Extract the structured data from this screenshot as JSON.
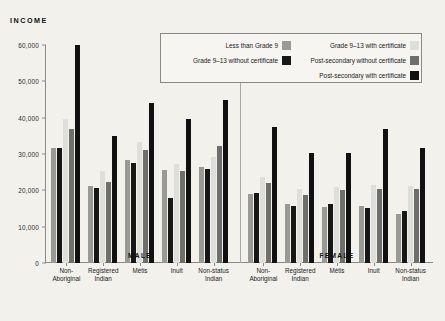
{
  "chart_data": {
    "type": "bar",
    "title": "",
    "ylabel": "INCOME",
    "xlabel": "",
    "ylim": [
      0,
      60000
    ],
    "yticks": [
      0,
      10000,
      20000,
      30000,
      40000,
      50000,
      60000
    ],
    "ytick_labels": [
      "0",
      "10,000",
      "20,000",
      "30,000",
      "40,000",
      "50,000",
      "60,000"
    ],
    "grid": false,
    "legend_position": "top-right",
    "panels": [
      {
        "name": "MALE",
        "categories": [
          "Non-\nAboriginal",
          "Registered\nIndian",
          "Métis",
          "Inuit",
          "Non-status\nIndian"
        ],
        "series": [
          {
            "name": "Less than Grade 9",
            "values": [
              31800,
              21200,
              28400,
              25600,
              26400
            ]
          },
          {
            "name": "Grade 9–13 without certificate",
            "values": [
              31800,
              20600,
              27600,
              17800,
              26000
            ]
          },
          {
            "name": "Grade 9–13 with certificate",
            "values": [
              39600,
              25400,
              33400,
              27200,
              29200
            ]
          },
          {
            "name": "Post-secondary without certificate",
            "values": [
              36800,
              22400,
              31200,
              25200,
              32300
            ]
          },
          {
            "name": "Post-secondary with certificate",
            "values": [
              60000,
              35000,
              44000,
              39600,
              45000
            ]
          }
        ]
      },
      {
        "name": "FEMALE",
        "categories": [
          "Non-\nAboriginal",
          "Registered\nIndian",
          "Métis",
          "Inuit",
          "Non-status\nIndian"
        ],
        "series": [
          {
            "name": "Less than Grade 9",
            "values": [
              19000,
              16200,
              15400,
              15800,
              13400
            ]
          },
          {
            "name": "Grade 9–13 without certificate",
            "values": [
              19400,
              15600,
              16200,
              15100,
              14400
            ]
          },
          {
            "name": "Grade 9–13 with certificate",
            "values": [
              23800,
              20300,
              21000,
              21600,
              21300
            ]
          },
          {
            "name": "Post-secondary without certificate",
            "values": [
              22000,
              18600,
              20200,
              20400,
              20500
            ]
          },
          {
            "name": "Post-secondary with certificate",
            "values": [
              37400,
              30300,
              30400,
              37000,
              31800
            ]
          }
        ]
      }
    ],
    "series_colors": [
      "#9a9a95",
      "#171717",
      "#dededa",
      "#6e6e6a",
      "#111111"
    ],
    "legend": {
      "left_column": [
        {
          "label": "Less than Grade 9",
          "color": "#9a9a95"
        },
        {
          "label": "Grade 9–13 without certificate",
          "color": "#171717"
        }
      ],
      "right_column": [
        {
          "label": "Grade 9–13 with certificate",
          "color": "#dededa"
        },
        {
          "label": "Post-secondary without certificate",
          "color": "#6e6e6a"
        },
        {
          "label": "Post-secondary with certificate",
          "color": "#111111"
        }
      ]
    }
  }
}
